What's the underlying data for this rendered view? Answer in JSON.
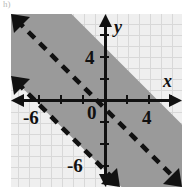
{
  "item_label": "h)",
  "chart_data": {
    "type": "line",
    "title": "",
    "subtitle": "",
    "xlabel": "x",
    "ylabel": "y",
    "xlim": [
      -8,
      8
    ],
    "ylim": [
      -8,
      8
    ],
    "grid": true,
    "grid_step": 1,
    "tick_step": 2,
    "legend": "none",
    "x_tick_values": [
      -6,
      -4,
      -2,
      0,
      2,
      4,
      6
    ],
    "y_tick_values": [
      -6,
      -4,
      -2,
      0,
      2,
      4,
      6
    ],
    "x_tick_labels_shown": [
      "-6",
      "4"
    ],
    "y_tick_labels_shown": [
      "4",
      "-6"
    ],
    "origin_label": "0",
    "series": [
      {
        "name": "upper-boundary",
        "type": "line",
        "style": "dashed",
        "slope": -1,
        "intercept": 5,
        "equation": "y = -x + 5",
        "arrows": "both",
        "x": [
          -8,
          8
        ],
        "values": [
          13,
          -3
        ]
      },
      {
        "name": "lower-boundary",
        "type": "line",
        "style": "dashed",
        "slope": -1,
        "intercept": -5,
        "equation": "y = -x - 5",
        "arrows": "both",
        "x": [
          -8,
          8
        ],
        "values": [
          3,
          -13
        ]
      }
    ],
    "shaded_region": {
      "name": "solution-band",
      "description": "region between the two dashed parallel lines",
      "inequalities": [
        "y < -x + 5",
        "y > -x - 5"
      ],
      "fill_color": "#9a9a9a",
      "boundary_included": false
    },
    "colors": {
      "background": "#efefef",
      "grid": "#d8d8d8",
      "axis": "#111111",
      "line": "#111111",
      "shade": "#9a9a9a"
    },
    "axis_labels": {
      "x": "x",
      "y": "y"
    },
    "tick_labels": {
      "x_neg6": "-6",
      "x_pos4": "4",
      "y_pos4": "4",
      "y_neg6": "-6",
      "origin": "0"
    }
  }
}
